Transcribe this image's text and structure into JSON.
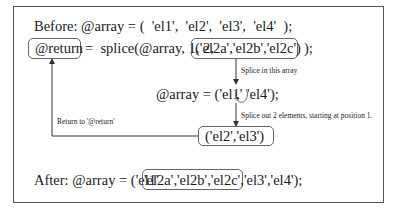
{
  "diagram": {
    "before_line": {
      "prefix": "Before: @array = (  'el1',  'el2',  'el3',  'el4'  );"
    },
    "splice_line": {
      "return_var": "@return",
      "call": "=  splice(@array, 1, 2,",
      "insert_list": "('el2a','el2b','el2c')",
      "suffix": ");"
    },
    "middle_line": {
      "prefix": "@array = ('el1'",
      "gap_comma": ",",
      "suffix": "'el4');"
    },
    "removed_box": "('el2','el3')",
    "after_line": {
      "prefix": "After: @array = ('el1'",
      "inserted": "'el2a','el2b','el2c',",
      "suffix": "'el3','el4');"
    },
    "annotations": {
      "splice_in": "Splice in this array",
      "splice_out": "Splice out 2 elements, starting at position 1.",
      "return_to": "Return to '@return'"
    },
    "colors": {
      "frame": "#555555",
      "text": "#1a1a1a",
      "arrow": "#333333",
      "box_border": "#666666"
    }
  }
}
